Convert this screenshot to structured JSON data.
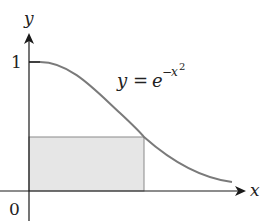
{
  "diagram": {
    "axes": {
      "x_label": "x",
      "y_label": "y",
      "origin_label": "0",
      "y_tick_label": "1"
    },
    "equation": {
      "lhs": "y",
      "equals": "=",
      "base": "e",
      "exponent_sign": "−",
      "exponent_var": "x",
      "exponent_power": "2"
    },
    "colors": {
      "curve": "#7a7a7a",
      "rectangle_fill": "#e6e6e6",
      "rectangle_stroke": "#8a8a8a",
      "axes": "#1a1a1a"
    }
  }
}
